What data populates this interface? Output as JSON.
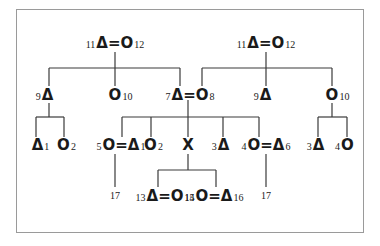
{
  "diagram": {
    "type": "kinship-chart",
    "nodes": {
      "left_parents": {
        "pre": "11",
        "sym": "Δ=O",
        "post": "12"
      },
      "right_parents": {
        "pre": "11",
        "sym": "Δ=O",
        "post": "12"
      },
      "l_son": {
        "pre": "9",
        "sym": "Δ",
        "post": ""
      },
      "l_daughter": {
        "pre": "",
        "sym": "O",
        "post": "10"
      },
      "l_couple": {
        "pre": "7",
        "sym": "Δ=O",
        "post": "8"
      },
      "r_son": {
        "pre": "9",
        "sym": "Δ",
        "post": ""
      },
      "r_daughter": {
        "pre": "",
        "sym": "O",
        "post": "10"
      },
      "g1": {
        "pre": "",
        "sym": "Δ",
        "post": "1"
      },
      "g2": {
        "pre": "",
        "sym": "O",
        "post": "2"
      },
      "c1": {
        "pre": "5",
        "sym": "O=Δ",
        "post": "1"
      },
      "c2": {
        "pre": "",
        "sym": "O",
        "post": "2"
      },
      "c3": {
        "pre": "",
        "sym": "X",
        "post": ""
      },
      "c4": {
        "pre": "3",
        "sym": "Δ",
        "post": ""
      },
      "c5": {
        "pre": "4",
        "sym": "O=Δ",
        "post": "6"
      },
      "r1": {
        "pre": "3",
        "sym": "Δ",
        "post": ""
      },
      "r2": {
        "pre": "4",
        "sym": "O",
        "post": ""
      },
      "x1": {
        "pre": "13",
        "sym": "Δ=O",
        "post": "15"
      },
      "x2": {
        "pre": "14",
        "sym": "O=Δ",
        "post": "16"
      },
      "d1": {
        "label": "17"
      },
      "d2": {
        "label": "17"
      }
    }
  }
}
